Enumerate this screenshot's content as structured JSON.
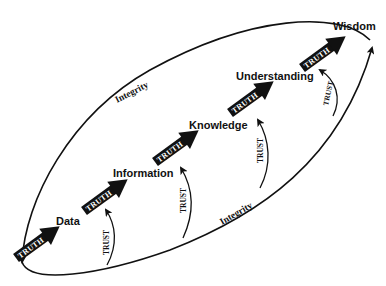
{
  "diagram": {
    "type": "DIKW hierarchy cycle",
    "stages": [
      {
        "label": "Data"
      },
      {
        "label": "Information"
      },
      {
        "label": "Knowledge"
      },
      {
        "label": "Understanding"
      },
      {
        "label": "Wisdom"
      }
    ],
    "truth_arrows": [
      {
        "label": "TRUTH"
      },
      {
        "label": "TRUTH"
      },
      {
        "label": "TRUTH"
      },
      {
        "label": "TRUTH"
      },
      {
        "label": "TRUTH"
      }
    ],
    "trust_arrows": [
      {
        "label": "TRUST"
      },
      {
        "label": "TRUST"
      },
      {
        "label": "TRUST"
      },
      {
        "label": "TRUST"
      }
    ],
    "loop_labels": {
      "upper": "Integrity",
      "lower": "Integrity"
    },
    "colors": {
      "ink": "#111111",
      "background": "#ffffff",
      "truth_text": "#ffffff"
    }
  }
}
